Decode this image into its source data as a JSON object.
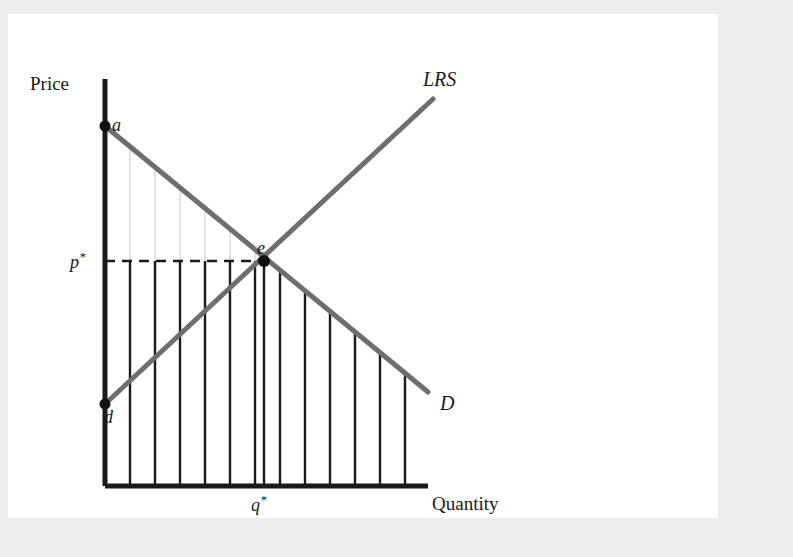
{
  "figure": {
    "axes": {
      "y_label": "Price",
      "x_label": "Quantity",
      "origin": {
        "x": 97,
        "y": 472
      },
      "y_top": 65,
      "x_right": 420
    },
    "curves": [
      {
        "id": "demand",
        "label": "D",
        "label_x": 432,
        "label_y": 396,
        "color": "#6e6e6e",
        "width": 5,
        "from": {
          "x": 97,
          "y": 112
        },
        "to": {
          "x": 420,
          "y": 378
        }
      },
      {
        "id": "long-run-supply",
        "label": "LRS",
        "label_x": 415,
        "label_y": 72,
        "color": "#6e6e6e",
        "width": 5,
        "from": {
          "x": 97,
          "y": 390
        },
        "to": {
          "x": 425,
          "y": 85
        }
      }
    ],
    "points": [
      {
        "id": "a",
        "label": "a",
        "x": 97,
        "y": 112,
        "label_x": 104,
        "label_y": 117
      },
      {
        "id": "d",
        "label": "d",
        "x": 97,
        "y": 390,
        "label_x": 96,
        "label_y": 409
      },
      {
        "id": "e",
        "label": "e",
        "x": 256,
        "y": 247,
        "label_x": 249,
        "label_y": 240
      }
    ],
    "equilibrium": {
      "price_label": "p",
      "price_superscript": "*",
      "price_label_x": 62,
      "price_label_y": 254,
      "quantity_label": "q",
      "quantity_superscript": "*",
      "quantity_label_x": 243,
      "quantity_label_y": 497,
      "price_y": 247,
      "quantity_x": 256,
      "dash_pattern": "10,7"
    },
    "hatching": {
      "count": 13,
      "spacing": 25,
      "first_x": 122,
      "surplus_above_color": "#dcdcdc",
      "surplus_above_width": 1.6,
      "surplus_below_color": "#1a1a1a",
      "surplus_below_width": 2.4
    },
    "colors": {
      "page_background": "#ffffff",
      "outer_background": "#ededed",
      "axis": "#1a1a1a",
      "curve": "#6e6e6e",
      "text": "#1a1a1a"
    }
  }
}
